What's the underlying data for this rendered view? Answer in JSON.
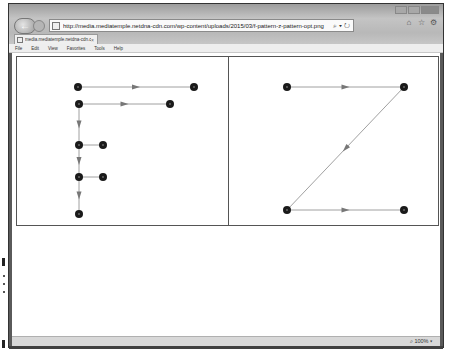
{
  "browser": {
    "url": "http://media.mediatemple.netdna-cdn.com/wp-content/uploads/2015/03/f-pattern-z-pattern-opt.png",
    "address_tools": "⌕ ▾ ↻",
    "tab_title": "media.mediatemple.netdna-cdn.c...",
    "tab_close": "×",
    "back_glyph": "←",
    "toolbar_icons": [
      "home-icon",
      "star-icon",
      "gear-icon"
    ],
    "toolbar_glyphs": [
      "⌂",
      "☆",
      "⚙"
    ],
    "menu": [
      "File",
      "Edit",
      "View",
      "Favorites",
      "Tools",
      "Help"
    ],
    "zoom_level": "⌕ 100%  ▾"
  },
  "image": {
    "description": "F-pattern and Z-pattern diagrams",
    "node_color": "#1a1a1a",
    "edge_color": "#888888",
    "f_pattern": {
      "nodes": [
        {
          "id": 1,
          "x": 61,
          "y": 30
        },
        {
          "id": 2,
          "x": 177,
          "y": 30
        },
        {
          "id": 3,
          "x": 62,
          "y": 47
        },
        {
          "id": 4,
          "x": 153,
          "y": 47
        },
        {
          "id": 5,
          "x": 62,
          "y": 88
        },
        {
          "id": 6,
          "x": 86,
          "y": 88
        },
        {
          "id": 7,
          "x": 62,
          "y": 120
        },
        {
          "id": 8,
          "x": 86,
          "y": 120
        },
        {
          "id": 9,
          "x": 62,
          "y": 157
        }
      ],
      "edges": [
        [
          1,
          2
        ],
        [
          3,
          4
        ],
        [
          3,
          5
        ],
        [
          5,
          6
        ],
        [
          5,
          7
        ],
        [
          7,
          8
        ],
        [
          7,
          9
        ]
      ]
    },
    "z_pattern": {
      "nodes": [
        {
          "id": 1,
          "x": 58,
          "y": 30
        },
        {
          "id": 2,
          "x": 175,
          "y": 30
        },
        {
          "id": 3,
          "x": 58,
          "y": 153
        },
        {
          "id": 4,
          "x": 175,
          "y": 153
        }
      ],
      "edges": [
        [
          1,
          2
        ],
        [
          2,
          3
        ],
        [
          3,
          4
        ]
      ]
    }
  }
}
